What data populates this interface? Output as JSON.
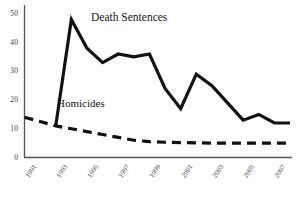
{
  "chart_data": {
    "type": "line",
    "title": "",
    "subtitle": "",
    "xlabel": "",
    "ylabel": "",
    "xlim": [
      1991,
      2008
    ],
    "ylim": [
      0,
      52
    ],
    "yticks": [
      0,
      10,
      20,
      30,
      40,
      50
    ],
    "xticks": [
      1991,
      1993,
      1995,
      1997,
      1999,
      2001,
      2003,
      2005,
      2007
    ],
    "xtick_labels": [
      "1991",
      "1993",
      "1995",
      "1997",
      "1999",
      "2001",
      "2003",
      "2005",
      "2007"
    ],
    "ytick_labels": [
      "0",
      "10",
      "20",
      "30",
      "40",
      "50"
    ],
    "grid": false,
    "legend_position": "inline-annotation",
    "x": [
      1991,
      1992,
      1993,
      1994,
      1995,
      1996,
      1997,
      1998,
      1999,
      2000,
      2001,
      2002,
      2003,
      2004,
      2005,
      2006,
      2007,
      2008
    ],
    "series": [
      {
        "name": "Death Sentences",
        "style": "solid",
        "color": "#111111",
        "linewidth": 3.2,
        "x": [
          1993,
          1994,
          1995,
          1996,
          1997,
          1998,
          1999,
          2000,
          2001,
          2002,
          2003,
          2004,
          2005,
          2006,
          2007,
          2008
        ],
        "values": [
          11,
          48,
          38,
          33,
          36,
          35,
          36,
          24,
          17,
          29,
          25,
          19,
          13,
          15,
          12,
          12
        ]
      },
      {
        "name": "Homicides",
        "style": "dashed",
        "color": "#111111",
        "linewidth": 3.2,
        "x": [
          1991,
          1992,
          1993,
          1994,
          1995,
          1996,
          1997,
          1998,
          1999,
          2000,
          2001,
          2002,
          2003,
          2004,
          2005,
          2006,
          2007,
          2008
        ],
        "values": [
          14,
          12.5,
          11,
          10,
          9,
          8,
          7,
          6,
          5.5,
          5.3,
          5.2,
          5.1,
          5,
          5,
          5,
          5,
          5,
          5
        ]
      }
    ],
    "annotations": [
      {
        "text": "Death Sentences",
        "series": "Death Sentences"
      },
      {
        "text": "Homicides",
        "series": "Homicides"
      }
    ]
  },
  "axis": {
    "axis_color": "#555555",
    "axis_linewidth": 1.2
  }
}
